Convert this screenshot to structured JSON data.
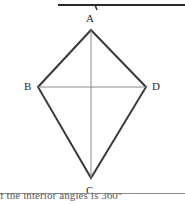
{
  "page": {
    "width": 185,
    "height": 204,
    "background_color": "#ffffff"
  },
  "top_divider": {
    "name": "horizontal-rule",
    "color": "#2a2a2a",
    "x1": 58,
    "y1": 3,
    "x2": 185,
    "y2": 3,
    "tick_x": 95,
    "tick_length": 5
  },
  "figure": {
    "shape_type": "kite",
    "outline_color": "#3a3a3a",
    "outline_width": 2,
    "diagonal_color": "#8a8a8a",
    "diagonal_width": 1,
    "vertices": [
      {
        "id": "A",
        "label": "A",
        "x": 91,
        "y": 30,
        "label_x": 86,
        "label_y": 13
      },
      {
        "id": "B",
        "label": "B",
        "x": 38,
        "y": 87,
        "label_x": 24,
        "label_y": 81
      },
      {
        "id": "C",
        "label": "C",
        "x": 91,
        "y": 178,
        "label_x": 86,
        "label_y": 185
      },
      {
        "id": "D",
        "label": "D",
        "x": 146,
        "y": 87,
        "label_x": 152,
        "label_y": 81
      }
    ],
    "edges": [
      {
        "from": "A",
        "to": "B"
      },
      {
        "from": "B",
        "to": "C"
      },
      {
        "from": "C",
        "to": "D"
      },
      {
        "from": "D",
        "to": "A"
      }
    ],
    "diagonals": [
      {
        "from": "A",
        "to": "C"
      },
      {
        "from": "B",
        "to": "D"
      }
    ],
    "intersection": {
      "x": 91,
      "y": 87
    }
  },
  "bottom_caption": {
    "text": "f the interior angles is 360°",
    "clipped": true,
    "color": "#5a5a5a"
  }
}
